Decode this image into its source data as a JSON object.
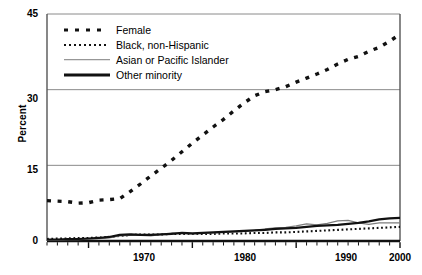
{
  "chart_data": {
    "type": "line",
    "title": "",
    "xlabel": "",
    "ylabel": "Percent",
    "xlim": [
      1966,
      2000
    ],
    "ylim": [
      0,
      45
    ],
    "yticks": [
      0,
      15,
      30,
      45
    ],
    "xticks": [
      1970,
      1980,
      1990,
      2000
    ],
    "grid": "horizontal",
    "legend_position": "top-left",
    "x": [
      1966,
      1967,
      1968,
      1969,
      1970,
      1971,
      1972,
      1973,
      1974,
      1975,
      1976,
      1977,
      1978,
      1979,
      1980,
      1981,
      1982,
      1983,
      1984,
      1985,
      1986,
      1987,
      1988,
      1989,
      1990,
      1991,
      1992,
      1993,
      1994,
      1995,
      1996,
      1997,
      1998,
      1999,
      2000
    ],
    "series": [
      {
        "name": "Female",
        "style": "square-dash",
        "color": "#111111",
        "values": [
          8.0,
          7.9,
          7.8,
          7.5,
          7.6,
          8.1,
          8.2,
          8.4,
          9.8,
          11.3,
          12.9,
          14.4,
          16.0,
          17.7,
          19.4,
          21.0,
          22.6,
          24.1,
          25.8,
          27.4,
          28.8,
          29.6,
          30.0,
          30.6,
          31.5,
          32.3,
          33.1,
          34.0,
          35.1,
          36.0,
          36.6,
          37.6,
          38.4,
          39.6,
          41.0
        ]
      },
      {
        "name": "Black, non-Hispanic",
        "style": "fine-dot",
        "color": "#111111",
        "values": [
          0.4,
          0.5,
          0.5,
          0.6,
          0.6,
          0.7,
          0.8,
          1.0,
          1.2,
          1.3,
          1.3,
          1.3,
          1.4,
          1.4,
          1.4,
          1.4,
          1.4,
          1.5,
          1.5,
          1.5,
          1.6,
          1.6,
          1.7,
          1.7,
          1.8,
          1.9,
          2.0,
          2.1,
          2.2,
          2.3,
          2.4,
          2.5,
          2.6,
          2.7,
          2.8
        ]
      },
      {
        "name": "Asian or Pacific Islander",
        "style": "thin-line",
        "color": "#7d7d7d",
        "values": [
          0.2,
          0.2,
          0.3,
          0.3,
          0.4,
          0.5,
          0.6,
          1.0,
          1.1,
          1.1,
          1.0,
          1.3,
          1.6,
          1.5,
          1.4,
          1.5,
          1.6,
          1.7,
          1.8,
          1.9,
          2.1,
          2.4,
          2.6,
          2.7,
          3.0,
          3.4,
          3.2,
          3.5,
          4.0,
          4.1,
          3.6,
          3.3,
          3.6,
          3.6,
          3.6
        ]
      },
      {
        "name": "Other minority",
        "style": "thick-line",
        "color": "#111111",
        "values": [
          0.3,
          0.3,
          0.4,
          0.4,
          0.5,
          0.6,
          0.8,
          1.2,
          1.3,
          1.2,
          1.2,
          1.3,
          1.4,
          1.6,
          1.5,
          1.6,
          1.7,
          1.8,
          1.9,
          2.0,
          2.1,
          2.2,
          2.4,
          2.5,
          2.6,
          2.8,
          3.0,
          3.1,
          3.2,
          3.4,
          3.6,
          3.9,
          4.3,
          4.5,
          4.6
        ]
      }
    ]
  },
  "axes": {
    "y_title": "Percent",
    "y_tick_labels": [
      "45",
      "30",
      "15",
      "0"
    ],
    "x_tick_labels": [
      "1970",
      "1980",
      "1990",
      "2000"
    ]
  },
  "legend": {
    "items": [
      {
        "label": "Female",
        "key": "square-dash-key"
      },
      {
        "label": "Black, non-Hispanic",
        "key": "fine-dot-key"
      },
      {
        "label": "Asian or Pacific Islander",
        "key": "thin-line-key"
      },
      {
        "label": "Other minority",
        "key": "thick-line-key"
      }
    ]
  }
}
